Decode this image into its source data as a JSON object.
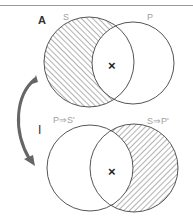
{
  "diagram": {
    "type": "venn-conversion",
    "colors": {
      "stroke": "#555555",
      "hatch": "#666666",
      "arrow": "#666666",
      "label": "#a0a0a0"
    },
    "top_panel": {
      "label": "A",
      "left_set": "S",
      "right_set": "P",
      "shaded_region": "S only",
      "marker": "×"
    },
    "bottom_panel": {
      "label": "I",
      "left_set": "P⇒S'",
      "right_set": "S⇒P'",
      "shaded_region": "right only",
      "marker": "×"
    },
    "arrow": {
      "direction": "top-to-bottom",
      "shape": "curved"
    }
  }
}
